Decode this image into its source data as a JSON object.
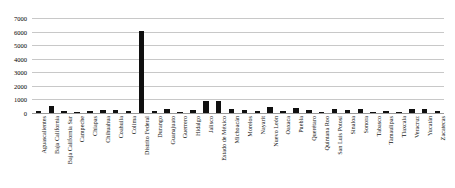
{
  "chart_data": {
    "type": "bar",
    "title": "",
    "subtitle": "",
    "xlabel": "",
    "ylabel": "",
    "ylim": [
      0,
      7000
    ],
    "ytick_step": 1000,
    "yticks": [
      "7000",
      "6000",
      "5000",
      "4000",
      "3000",
      "2000",
      "1000",
      "0"
    ],
    "grid": true,
    "legend": false,
    "legend_position": "none",
    "bar_color": "#101010",
    "grid_color": "#c8c8c8",
    "axis_color": "#9a9a9a",
    "categories": [
      "Aguascalientes",
      "Baja California",
      "Baja California Sur",
      "Campeche",
      "Chiapas",
      "Chihuahua",
      "Coahuila",
      "Colima",
      "Distrito Federal",
      "Durango",
      "Guanajuato",
      "Guerrero",
      "Hidalgo",
      "Jalisco",
      "Estado de México",
      "Michoacán",
      "Morelos",
      "Nayarit",
      "Nuevo León",
      "Oaxaca",
      "Puebla",
      "Querétaro",
      "Quintana Roo",
      "San Luis Potosí",
      "Sinaloa",
      "Sonora",
      "Tabasco",
      "Tamaulipas",
      "Tlaxcala",
      "Veracruz",
      "Yucatán",
      "Zacatecas"
    ],
    "values": [
      150,
      490,
      170,
      90,
      180,
      200,
      190,
      120,
      6050,
      140,
      330,
      110,
      230,
      900,
      880,
      300,
      250,
      120,
      410,
      130,
      350,
      250,
      90,
      270,
      200,
      290,
      110,
      150,
      100,
      330,
      300,
      120
    ]
  }
}
